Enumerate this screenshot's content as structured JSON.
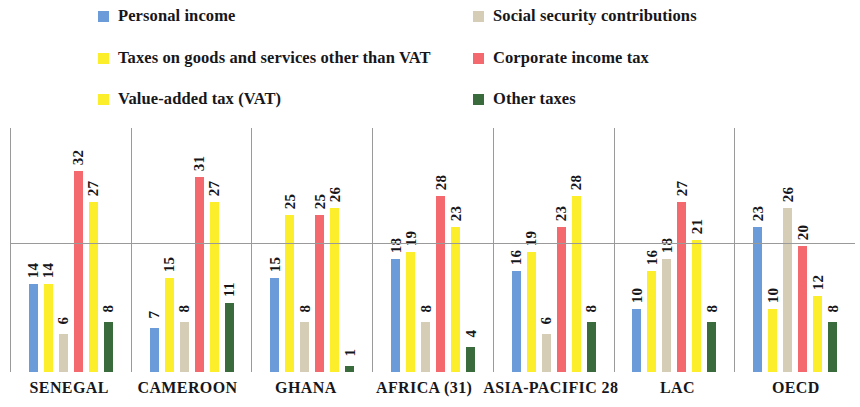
{
  "chart_data": {
    "type": "bar",
    "title": "",
    "subtitle": "",
    "xlabel": "",
    "ylabel": "",
    "ylim": [
      0,
      34
    ],
    "grid": false,
    "legend_position": "top",
    "grouped": true,
    "categories": [
      "SENEGAL",
      "CAMEROON",
      "GHANA",
      "AFRICA (31)",
      "ASIA-PACIFIC 28",
      "LAC",
      "OECD"
    ],
    "series": [
      {
        "name": "Personal income",
        "color": "#6b9bd8",
        "values": [
          14,
          7,
          15,
          18,
          16,
          10,
          23
        ]
      },
      {
        "name": "Taxes on goods and services other than VAT",
        "color": "#fdee2c",
        "values": [
          14,
          15,
          25,
          19,
          19,
          16,
          10
        ]
      },
      {
        "name": "Social security contributions",
        "color": "#d6cdb6",
        "values": [
          6,
          8,
          8,
          8,
          6,
          18,
          26
        ]
      },
      {
        "name": "Corporate income tax",
        "color": "#f4696e",
        "values": [
          32,
          31,
          25,
          28,
          23,
          27,
          20
        ]
      },
      {
        "name": "Value-added tax (VAT)",
        "color": "#fdee2c",
        "values": [
          27,
          27,
          26,
          23,
          28,
          21,
          12
        ]
      },
      {
        "name": "Other taxes",
        "color": "#3a6b3c",
        "values": [
          8,
          11,
          1,
          4,
          8,
          8,
          8
        ]
      }
    ]
  },
  "legend": {
    "items": [
      {
        "label": "Personal income",
        "color": "#6b9bd8",
        "column": "a",
        "row": 1
      },
      {
        "label": "Taxes on goods and services other than VAT",
        "color": "#fdee2c",
        "column": "a",
        "row": 2
      },
      {
        "label": "Value-added tax (VAT)",
        "color": "#fdee2c",
        "column": "a",
        "row": 3
      },
      {
        "label": "Social security contributions",
        "color": "#d6cdb6",
        "column": "b",
        "row": 1
      },
      {
        "label": "Corporate income tax",
        "color": "#f4696e",
        "column": "b",
        "row": 2
      },
      {
        "label": "Other taxes",
        "color": "#3a6b3c",
        "column": "b",
        "row": 3
      }
    ]
  }
}
